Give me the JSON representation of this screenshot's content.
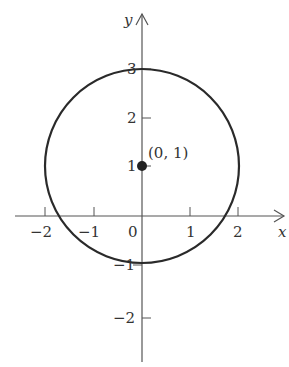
{
  "diagram": {
    "type": "circle-on-axes",
    "axes": {
      "x_label": "x",
      "y_label": "y",
      "origin_label": "0",
      "x_ticks": [
        {
          "value": -2,
          "label": "−2"
        },
        {
          "value": -1,
          "label": "−1"
        },
        {
          "value": 1,
          "label": "1"
        },
        {
          "value": 2,
          "label": "2"
        }
      ],
      "y_ticks": [
        {
          "value": 3,
          "label": "3"
        },
        {
          "value": 2,
          "label": "2"
        },
        {
          "value": 1,
          "label": "1"
        },
        {
          "value": -1,
          "label": "−1"
        },
        {
          "value": -2,
          "label": "−2"
        }
      ]
    },
    "circle": {
      "center": [
        0,
        1
      ],
      "radius": 2
    },
    "center_point": {
      "label": "(0, 1)"
    },
    "colors": {
      "stroke": "#2a2a2a",
      "axis": "#555555",
      "text": "#333333"
    }
  }
}
